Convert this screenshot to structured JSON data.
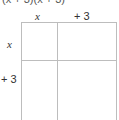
{
  "expression": "(x + 3)(x + 3)",
  "columns": [
    {
      "label": "x",
      "italic": true
    },
    {
      "label": "+ 3",
      "italic": false
    }
  ],
  "rows": [
    {
      "label": "x",
      "italic": true
    },
    {
      "label": "+ 3",
      "italic": false
    }
  ],
  "cells": [
    [
      "",
      ""
    ],
    [
      "",
      ""
    ]
  ]
}
